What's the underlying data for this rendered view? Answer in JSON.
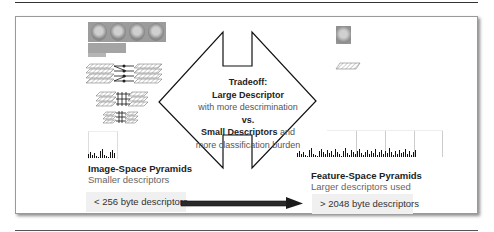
{
  "diagram": {
    "center": {
      "title": "Tradeoff:",
      "line1_bold": "Large Descriptor",
      "line2": "with more descrimination",
      "line3_bold": "vs.",
      "line4_bold": "Small Descriptors",
      "line4_rest": " and",
      "line5": "more classification burden"
    },
    "left": {
      "title": "Image-Space Pyramids",
      "subtitle": "Smaller descriptors",
      "size_label": "< 256 byte descriptors",
      "hist_bars": [
        4,
        6,
        3,
        5,
        2,
        1,
        7,
        9,
        3,
        2,
        1,
        6,
        8,
        5
      ]
    },
    "right": {
      "title": "Feature-Space Pyramids",
      "subtitle": "Larger descriptors used",
      "size_label": "> 2048 byte descriptors",
      "hist_bars": [
        4,
        6,
        3,
        5,
        2,
        1,
        7,
        9,
        3,
        2,
        1,
        6,
        8,
        5,
        3,
        7,
        4,
        6,
        2,
        8,
        5,
        3,
        1,
        6,
        9,
        4,
        2,
        7,
        5,
        3,
        6,
        8,
        4,
        2,
        5,
        7,
        3,
        6,
        4,
        8,
        2,
        5,
        7,
        3,
        6,
        4,
        9,
        5,
        2,
        6,
        3,
        7,
        4,
        5,
        8,
        3,
        6,
        2,
        5,
        7
      ]
    },
    "arrow": {
      "direction": "right",
      "color": "#222222"
    }
  }
}
